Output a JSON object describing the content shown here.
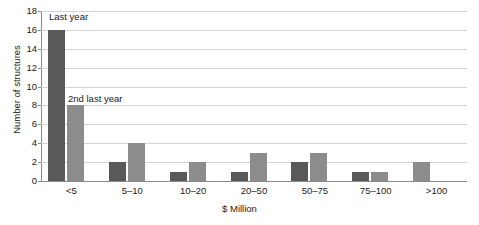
{
  "chart_data": {
    "type": "bar",
    "title": "",
    "subtitle": "",
    "xlabel": "$ Million",
    "ylabel": "Number of structures",
    "categories": [
      "<5",
      "5–10",
      "10–20",
      "20–50",
      "50–75",
      "75–100",
      ">100"
    ],
    "series": [
      {
        "name": "Last year",
        "color": "#595959",
        "values": [
          16,
          2,
          1,
          1,
          2,
          1,
          0
        ]
      },
      {
        "name": "2nd last year",
        "color": "#8c8c8c",
        "values": [
          8,
          4,
          2,
          3,
          3,
          1,
          2
        ]
      }
    ],
    "ylim": [
      0,
      18
    ],
    "ytick_step": 2,
    "yticks": [
      "18",
      "16",
      "14",
      "12",
      "10",
      "8",
      "6",
      "4",
      "2",
      "0"
    ],
    "grid": "horizontal",
    "legend": "none",
    "annotations": [
      {
        "text": "Last year",
        "series": "Last year",
        "category": "<5"
      },
      {
        "text": "2nd last year",
        "series": "2nd last year",
        "category": "<5"
      }
    ],
    "notes": {
      "last_bar_placement": "The >100 value of 2 is drawn in the left bar slot using the 2nd last year fill."
    }
  }
}
